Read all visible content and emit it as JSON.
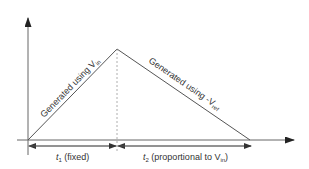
{
  "diagram": {
    "type": "dual-slope integration waveform",
    "colors": {
      "line": "#555555",
      "text": "#333333",
      "background": "#ffffff"
    },
    "ramp_up_label": {
      "prefix": "Generated using V",
      "sub": "in"
    },
    "ramp_down_label": {
      "prefix": "Generated using -V",
      "sub": "ref"
    },
    "t1_label": {
      "var": "t",
      "sub": "1",
      "suffix": " (fixed)"
    },
    "t2_label": {
      "var": "t",
      "sub": "2",
      "suffix": " (proportional to V",
      "sub2": "in",
      "end": ")"
    }
  }
}
